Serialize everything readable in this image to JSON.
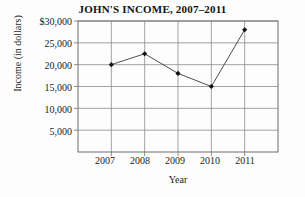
{
  "chart_data": {
    "type": "line",
    "title": "JOHN'S INCOME, 2007–2011",
    "xlabel": "Year",
    "ylabel": "Income (in dollars)",
    "categories": [
      "2007",
      "2008",
      "2009",
      "2010",
      "2011"
    ],
    "values": [
      20000,
      22500,
      18000,
      15000,
      28000
    ],
    "series": [
      {
        "name": "Income",
        "values": [
          20000,
          22500,
          18000,
          15000,
          28000
        ]
      }
    ],
    "ylim": [
      0,
      30000
    ],
    "yticks": [
      5000,
      10000,
      15000,
      20000,
      25000,
      30000
    ],
    "ytick_labels": [
      "5,000",
      "10,000",
      "15,000",
      "20,000",
      "25,000",
      "$30,000"
    ],
    "xtick_labels": [
      "2007",
      "2008",
      "2009",
      "2010",
      "2011"
    ],
    "grid": true,
    "legend": false,
    "legend_position": "none",
    "line_color": "#3a3a3a",
    "marker_color": "#111111",
    "grid_color": "#8c8c8c",
    "axis_color": "#6f6f6f",
    "background_color": "#fdfdfd"
  }
}
